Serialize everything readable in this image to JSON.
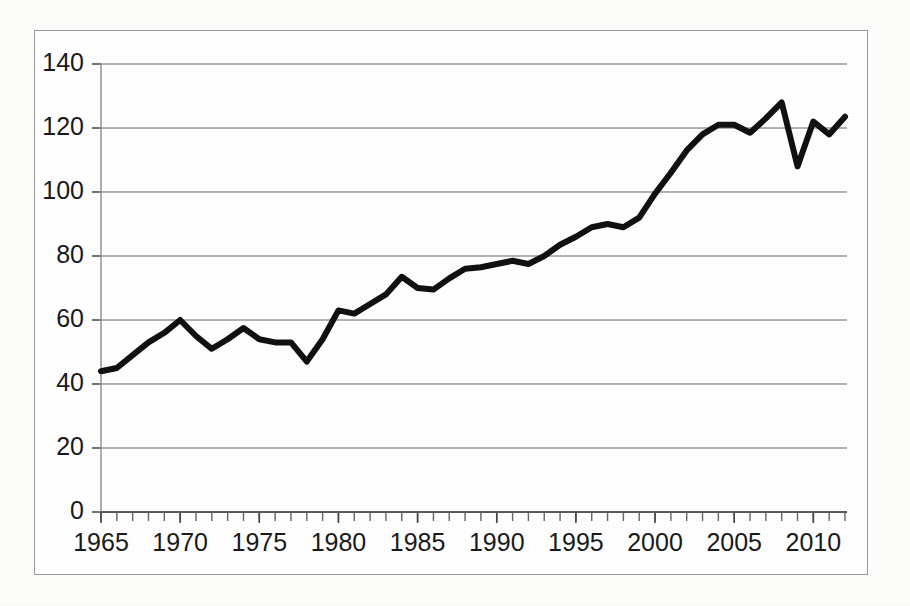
{
  "chart_data": {
    "type": "line",
    "title": "",
    "subtitle": "",
    "xlabel": "",
    "ylabel": "",
    "xlim": [
      1965,
      2012
    ],
    "ylim": [
      0,
      140
    ],
    "grid": "horizontal",
    "legend": "none",
    "y_ticks": [
      0,
      20,
      40,
      60,
      80,
      100,
      120,
      140
    ],
    "y_tick_labels": [
      "0",
      "20",
      "40",
      "60",
      "80",
      "100",
      "120",
      "140"
    ],
    "x_ticks": [
      1965,
      1970,
      1975,
      1980,
      1985,
      1990,
      1995,
      2000,
      2005,
      2010
    ],
    "x_tick_labels": [
      "1965",
      "1970",
      "1975",
      "1980",
      "1985",
      "1990",
      "1995",
      "2000",
      "2005",
      "2010"
    ],
    "x_minor_tick_interval": 1,
    "line_color": "#111111",
    "line_width": 6,
    "grid_color": "#9a9a9a",
    "x": [
      1965,
      1966,
      1967,
      1968,
      1969,
      1970,
      1971,
      1972,
      1973,
      1974,
      1975,
      1976,
      1977,
      1978,
      1979,
      1980,
      1981,
      1982,
      1983,
      1984,
      1985,
      1986,
      1987,
      1988,
      1989,
      1990,
      1991,
      1992,
      1993,
      1994,
      1995,
      1996,
      1997,
      1998,
      1999,
      2000,
      2001,
      2002,
      2003,
      2004,
      2005,
      2006,
      2007,
      2008,
      2009,
      2010,
      2011,
      2012
    ],
    "values": [
      44,
      45,
      49,
      53,
      56,
      60,
      55,
      51,
      54,
      57.5,
      54,
      53,
      53,
      47,
      54,
      63,
      62,
      65,
      68,
      73.5,
      70,
      69.5,
      73,
      76,
      76.5,
      77.5,
      78.5,
      77.5,
      80,
      83.5,
      86,
      89,
      90,
      89,
      92,
      99.5,
      106,
      113,
      118,
      121,
      121,
      118.5,
      123,
      128,
      108,
      122,
      118,
      123.5
    ],
    "series": [
      {
        "name": "series-1",
        "values": [
          44,
          45,
          49,
          53,
          56,
          60,
          55,
          51,
          54,
          57.5,
          54,
          53,
          53,
          47,
          54,
          63,
          62,
          65,
          68,
          73.5,
          70,
          69.5,
          73,
          76,
          76.5,
          77.5,
          78.5,
          77.5,
          80,
          83.5,
          86,
          89,
          90,
          89,
          92,
          99.5,
          106,
          113,
          118,
          121,
          121,
          118.5,
          123,
          128,
          108,
          122,
          118,
          123.5
        ]
      }
    ]
  }
}
